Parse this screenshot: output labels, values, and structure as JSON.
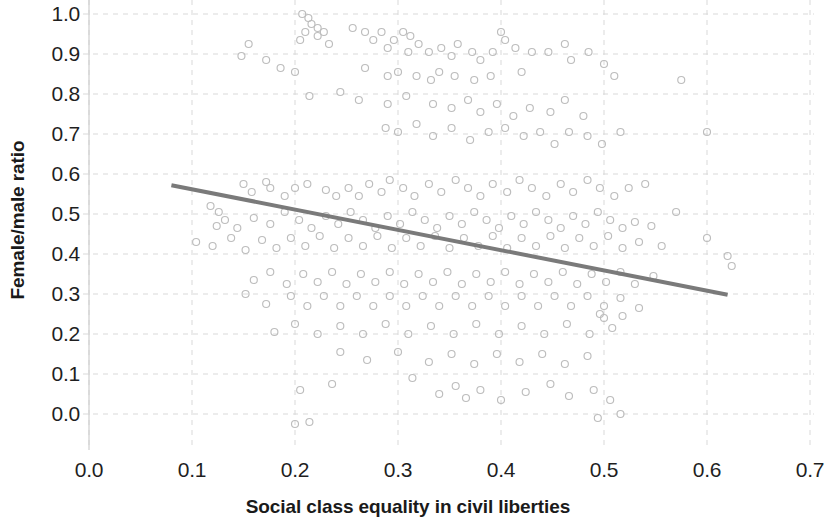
{
  "chart_data": {
    "type": "scatter",
    "title": "",
    "xlabel": "Social class equality in civil liberties",
    "ylabel": "Female/male ratio",
    "xlim": [
      0.0,
      0.7
    ],
    "ylim": [
      0.0,
      1.0
    ],
    "xticks": [
      "0.0",
      "0.1",
      "0.2",
      "0.3",
      "0.4",
      "0.5",
      "0.6",
      "0.7"
    ],
    "yticks": [
      "0.0",
      "0.1",
      "0.2",
      "0.3",
      "0.4",
      "0.5",
      "0.6",
      "0.7",
      "0.8",
      "0.9",
      "1.0"
    ],
    "grid": true,
    "grid_style": "dashed",
    "grid_color": "#d9d9d9",
    "legend": "none",
    "marker": {
      "style": "open-circle",
      "color": "#bdbdbd",
      "size": 7
    },
    "trendline": {
      "type": "linear",
      "color": "#7a7a7a",
      "width": 4,
      "x_start": 0.08,
      "y_start": 0.572,
      "x_end": 0.62,
      "y_end": 0.298,
      "slope": -0.507,
      "intercept": 0.613
    },
    "n_points": 283,
    "points": [
      [
        0.207,
        1.0
      ],
      [
        0.213,
        0.99
      ],
      [
        0.216,
        0.975
      ],
      [
        0.222,
        0.965
      ],
      [
        0.21,
        0.955
      ],
      [
        0.222,
        0.945
      ],
      [
        0.228,
        0.955
      ],
      [
        0.205,
        0.935
      ],
      [
        0.233,
        0.925
      ],
      [
        0.256,
        0.965
      ],
      [
        0.268,
        0.955
      ],
      [
        0.276,
        0.935
      ],
      [
        0.284,
        0.955
      ],
      [
        0.29,
        0.915
      ],
      [
        0.296,
        0.935
      ],
      [
        0.305,
        0.955
      ],
      [
        0.312,
        0.945
      ],
      [
        0.31,
        0.905
      ],
      [
        0.32,
        0.925
      ],
      [
        0.33,
        0.905
      ],
      [
        0.342,
        0.915
      ],
      [
        0.352,
        0.895
      ],
      [
        0.358,
        0.925
      ],
      [
        0.372,
        0.905
      ],
      [
        0.38,
        0.885
      ],
      [
        0.392,
        0.905
      ],
      [
        0.4,
        0.955
      ],
      [
        0.404,
        0.935
      ],
      [
        0.414,
        0.915
      ],
      [
        0.43,
        0.905
      ],
      [
        0.155,
        0.925
      ],
      [
        0.148,
        0.895
      ],
      [
        0.172,
        0.885
      ],
      [
        0.186,
        0.865
      ],
      [
        0.2,
        0.855
      ],
      [
        0.268,
        0.865
      ],
      [
        0.29,
        0.845
      ],
      [
        0.3,
        0.855
      ],
      [
        0.318,
        0.845
      ],
      [
        0.332,
        0.835
      ],
      [
        0.34,
        0.855
      ],
      [
        0.355,
        0.845
      ],
      [
        0.374,
        0.835
      ],
      [
        0.39,
        0.845
      ],
      [
        0.42,
        0.855
      ],
      [
        0.446,
        0.905
      ],
      [
        0.462,
        0.925
      ],
      [
        0.468,
        0.885
      ],
      [
        0.485,
        0.905
      ],
      [
        0.5,
        0.875
      ],
      [
        0.51,
        0.845
      ],
      [
        0.575,
        0.835
      ],
      [
        0.214,
        0.795
      ],
      [
        0.244,
        0.805
      ],
      [
        0.262,
        0.785
      ],
      [
        0.29,
        0.775
      ],
      [
        0.308,
        0.795
      ],
      [
        0.334,
        0.775
      ],
      [
        0.352,
        0.765
      ],
      [
        0.368,
        0.785
      ],
      [
        0.38,
        0.755
      ],
      [
        0.396,
        0.775
      ],
      [
        0.412,
        0.745
      ],
      [
        0.428,
        0.765
      ],
      [
        0.448,
        0.755
      ],
      [
        0.462,
        0.785
      ],
      [
        0.48,
        0.745
      ],
      [
        0.288,
        0.715
      ],
      [
        0.3,
        0.705
      ],
      [
        0.318,
        0.725
      ],
      [
        0.334,
        0.695
      ],
      [
        0.352,
        0.715
      ],
      [
        0.37,
        0.685
      ],
      [
        0.388,
        0.705
      ],
      [
        0.404,
        0.715
      ],
      [
        0.422,
        0.695
      ],
      [
        0.438,
        0.705
      ],
      [
        0.452,
        0.675
      ],
      [
        0.466,
        0.705
      ],
      [
        0.484,
        0.695
      ],
      [
        0.498,
        0.675
      ],
      [
        0.516,
        0.705
      ],
      [
        0.6,
        0.705
      ],
      [
        0.172,
        0.58
      ],
      [
        0.176,
        0.565
      ],
      [
        0.15,
        0.575
      ],
      [
        0.158,
        0.555
      ],
      [
        0.19,
        0.545
      ],
      [
        0.2,
        0.565
      ],
      [
        0.212,
        0.575
      ],
      [
        0.23,
        0.56
      ],
      [
        0.24,
        0.545
      ],
      [
        0.252,
        0.565
      ],
      [
        0.262,
        0.545
      ],
      [
        0.272,
        0.575
      ],
      [
        0.284,
        0.555
      ],
      [
        0.292,
        0.585
      ],
      [
        0.305,
        0.565
      ],
      [
        0.316,
        0.545
      ],
      [
        0.33,
        0.575
      ],
      [
        0.342,
        0.555
      ],
      [
        0.356,
        0.585
      ],
      [
        0.368,
        0.565
      ],
      [
        0.38,
        0.545
      ],
      [
        0.392,
        0.575
      ],
      [
        0.406,
        0.555
      ],
      [
        0.418,
        0.585
      ],
      [
        0.43,
        0.565
      ],
      [
        0.444,
        0.545
      ],
      [
        0.458,
        0.575
      ],
      [
        0.47,
        0.555
      ],
      [
        0.484,
        0.585
      ],
      [
        0.496,
        0.565
      ],
      [
        0.51,
        0.545
      ],
      [
        0.524,
        0.565
      ],
      [
        0.54,
        0.575
      ],
      [
        0.118,
        0.52
      ],
      [
        0.126,
        0.505
      ],
      [
        0.132,
        0.485
      ],
      [
        0.124,
        0.47
      ],
      [
        0.144,
        0.465
      ],
      [
        0.16,
        0.49
      ],
      [
        0.176,
        0.475
      ],
      [
        0.19,
        0.505
      ],
      [
        0.204,
        0.485
      ],
      [
        0.216,
        0.465
      ],
      [
        0.23,
        0.495
      ],
      [
        0.242,
        0.475
      ],
      [
        0.254,
        0.505
      ],
      [
        0.266,
        0.485
      ],
      [
        0.278,
        0.465
      ],
      [
        0.29,
        0.495
      ],
      [
        0.302,
        0.475
      ],
      [
        0.314,
        0.505
      ],
      [
        0.326,
        0.485
      ],
      [
        0.338,
        0.465
      ],
      [
        0.35,
        0.495
      ],
      [
        0.362,
        0.475
      ],
      [
        0.374,
        0.505
      ],
      [
        0.386,
        0.485
      ],
      [
        0.398,
        0.465
      ],
      [
        0.41,
        0.495
      ],
      [
        0.422,
        0.475
      ],
      [
        0.434,
        0.505
      ],
      [
        0.446,
        0.485
      ],
      [
        0.458,
        0.465
      ],
      [
        0.47,
        0.495
      ],
      [
        0.482,
        0.475
      ],
      [
        0.494,
        0.505
      ],
      [
        0.506,
        0.485
      ],
      [
        0.518,
        0.465
      ],
      [
        0.53,
        0.48
      ],
      [
        0.546,
        0.47
      ],
      [
        0.57,
        0.505
      ],
      [
        0.6,
        0.44
      ],
      [
        0.104,
        0.43
      ],
      [
        0.12,
        0.42
      ],
      [
        0.138,
        0.44
      ],
      [
        0.152,
        0.41
      ],
      [
        0.168,
        0.435
      ],
      [
        0.182,
        0.415
      ],
      [
        0.196,
        0.44
      ],
      [
        0.21,
        0.42
      ],
      [
        0.224,
        0.445
      ],
      [
        0.238,
        0.415
      ],
      [
        0.252,
        0.44
      ],
      [
        0.266,
        0.42
      ],
      [
        0.28,
        0.445
      ],
      [
        0.294,
        0.415
      ],
      [
        0.308,
        0.44
      ],
      [
        0.322,
        0.42
      ],
      [
        0.336,
        0.445
      ],
      [
        0.35,
        0.415
      ],
      [
        0.364,
        0.44
      ],
      [
        0.378,
        0.42
      ],
      [
        0.392,
        0.445
      ],
      [
        0.406,
        0.415
      ],
      [
        0.42,
        0.44
      ],
      [
        0.434,
        0.42
      ],
      [
        0.448,
        0.445
      ],
      [
        0.462,
        0.415
      ],
      [
        0.476,
        0.44
      ],
      [
        0.49,
        0.42
      ],
      [
        0.504,
        0.445
      ],
      [
        0.518,
        0.415
      ],
      [
        0.534,
        0.43
      ],
      [
        0.556,
        0.42
      ],
      [
        0.16,
        0.335
      ],
      [
        0.176,
        0.355
      ],
      [
        0.192,
        0.325
      ],
      [
        0.208,
        0.35
      ],
      [
        0.222,
        0.33
      ],
      [
        0.236,
        0.355
      ],
      [
        0.25,
        0.325
      ],
      [
        0.264,
        0.35
      ],
      [
        0.278,
        0.33
      ],
      [
        0.292,
        0.355
      ],
      [
        0.306,
        0.325
      ],
      [
        0.32,
        0.35
      ],
      [
        0.334,
        0.33
      ],
      [
        0.348,
        0.355
      ],
      [
        0.362,
        0.325
      ],
      [
        0.376,
        0.35
      ],
      [
        0.39,
        0.33
      ],
      [
        0.404,
        0.355
      ],
      [
        0.418,
        0.325
      ],
      [
        0.432,
        0.35
      ],
      [
        0.446,
        0.33
      ],
      [
        0.46,
        0.355
      ],
      [
        0.474,
        0.325
      ],
      [
        0.488,
        0.35
      ],
      [
        0.502,
        0.33
      ],
      [
        0.516,
        0.355
      ],
      [
        0.53,
        0.325
      ],
      [
        0.548,
        0.345
      ],
      [
        0.62,
        0.395
      ],
      [
        0.624,
        0.37
      ],
      [
        0.152,
        0.3
      ],
      [
        0.172,
        0.275
      ],
      [
        0.196,
        0.295
      ],
      [
        0.212,
        0.27
      ],
      [
        0.228,
        0.295
      ],
      [
        0.244,
        0.27
      ],
      [
        0.26,
        0.295
      ],
      [
        0.276,
        0.27
      ],
      [
        0.292,
        0.295
      ],
      [
        0.308,
        0.27
      ],
      [
        0.324,
        0.295
      ],
      [
        0.34,
        0.27
      ],
      [
        0.356,
        0.295
      ],
      [
        0.372,
        0.27
      ],
      [
        0.388,
        0.295
      ],
      [
        0.404,
        0.27
      ],
      [
        0.42,
        0.295
      ],
      [
        0.436,
        0.27
      ],
      [
        0.452,
        0.295
      ],
      [
        0.468,
        0.27
      ],
      [
        0.484,
        0.295
      ],
      [
        0.5,
        0.27
      ],
      [
        0.516,
        0.29
      ],
      [
        0.534,
        0.265
      ],
      [
        0.18,
        0.205
      ],
      [
        0.2,
        0.225
      ],
      [
        0.222,
        0.2
      ],
      [
        0.244,
        0.22
      ],
      [
        0.266,
        0.2
      ],
      [
        0.288,
        0.225
      ],
      [
        0.31,
        0.2
      ],
      [
        0.332,
        0.22
      ],
      [
        0.354,
        0.2
      ],
      [
        0.376,
        0.225
      ],
      [
        0.398,
        0.2
      ],
      [
        0.42,
        0.22
      ],
      [
        0.442,
        0.2
      ],
      [
        0.464,
        0.225
      ],
      [
        0.486,
        0.2
      ],
      [
        0.5,
        0.24
      ],
      [
        0.508,
        0.215
      ],
      [
        0.496,
        0.25
      ],
      [
        0.518,
        0.245
      ],
      [
        0.244,
        0.155
      ],
      [
        0.27,
        0.135
      ],
      [
        0.3,
        0.155
      ],
      [
        0.33,
        0.13
      ],
      [
        0.352,
        0.15
      ],
      [
        0.374,
        0.125
      ],
      [
        0.396,
        0.15
      ],
      [
        0.418,
        0.13
      ],
      [
        0.44,
        0.15
      ],
      [
        0.462,
        0.125
      ],
      [
        0.484,
        0.145
      ],
      [
        0.205,
        0.06
      ],
      [
        0.236,
        0.075
      ],
      [
        0.314,
        0.09
      ],
      [
        0.34,
        0.05
      ],
      [
        0.356,
        0.07
      ],
      [
        0.366,
        0.04
      ],
      [
        0.38,
        0.06
      ],
      [
        0.4,
        0.035
      ],
      [
        0.424,
        0.055
      ],
      [
        0.448,
        0.075
      ],
      [
        0.466,
        0.045
      ],
      [
        0.49,
        0.06
      ],
      [
        0.506,
        0.035
      ],
      [
        0.2,
        -0.025
      ],
      [
        0.214,
        -0.02
      ],
      [
        0.494,
        -0.01
      ],
      [
        0.516,
        0.0
      ]
    ]
  }
}
